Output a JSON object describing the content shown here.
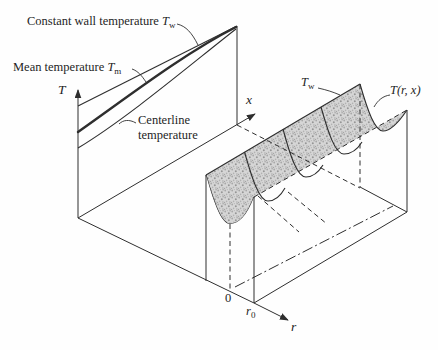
{
  "figure": {
    "colors": {
      "ink": "#2e2e2e",
      "paper": "#fefefe",
      "stipple_base": "#d6d6d6",
      "stipple_dot": "#9b9b9b"
    },
    "labels": {
      "constant_wall": {
        "text": "Constant wall temperature ",
        "var": "T",
        "sub": "w"
      },
      "mean_temperature": {
        "text": "Mean temperature ",
        "var": "T",
        "sub": "m"
      },
      "centerline": {
        "line1": "Centerline",
        "line2": "temperature"
      },
      "t_axis": "T",
      "x_axis": "x",
      "r_axis": "r",
      "wall_surface": {
        "var": "T",
        "sub": "w"
      },
      "surface_function": "T(r, x)",
      "origin": "0",
      "wall_radius": {
        "var": "r",
        "sub": "0"
      }
    }
  }
}
